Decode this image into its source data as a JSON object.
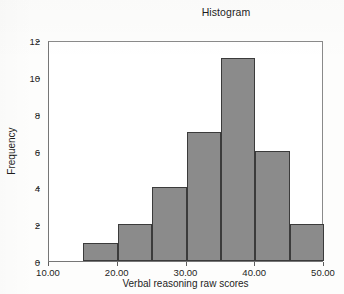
{
  "chart_data": {
    "type": "bar",
    "title": "Histogram",
    "xlabel": "Verbal reasoning raw scores",
    "ylabel": "Frequency",
    "xlim": [
      10,
      50
    ],
    "ylim": [
      0,
      12
    ],
    "grid": false,
    "legend": null,
    "bin_width": 5,
    "bin_edges": [
      15,
      20,
      25,
      30,
      35,
      40,
      45,
      50
    ],
    "bin_labels": [
      "15-20",
      "20-25",
      "25-30",
      "30-35",
      "35-40",
      "40-45",
      "45-50"
    ],
    "categories": [
      "15",
      "20",
      "25",
      "30",
      "35",
      "40",
      "45"
    ],
    "values": [
      1,
      2,
      4,
      7,
      11,
      6,
      2
    ],
    "x_tick_labels": [
      "10.00",
      "20.00",
      "30.00",
      "40.00",
      "50.00"
    ],
    "x_tick_values": [
      10,
      20,
      30,
      40,
      50
    ],
    "y_tick_labels": [
      "0",
      "2",
      "4",
      "6",
      "8",
      "10",
      "12"
    ],
    "y_tick_values": [
      0,
      2,
      4,
      6,
      8,
      10,
      12
    ],
    "bar_fill_color": "#8b8b8b",
    "bar_edge_color": "#3b3b3b",
    "plot_background_color": "#ffffff",
    "axis_color": "#767676",
    "text_color": "#1d1d1d",
    "total_count": 33
  }
}
